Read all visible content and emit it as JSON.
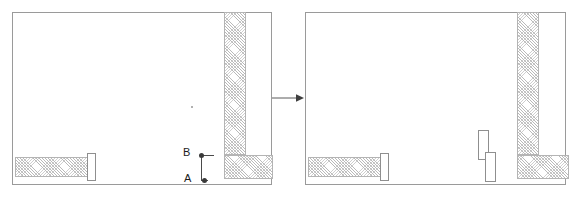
{
  "figure": {
    "name": "wall-opening-transformation-diagram",
    "type": "before-after floor plan pair",
    "panel_count": 2
  },
  "colors": {
    "panel_border": "#9a9a9a",
    "wall_outline": "#b4b4b4",
    "wall_hatch": "#b9b9b9",
    "opening_outline": "#8f8f8f",
    "point_marker": "#3a3a3a",
    "label_text": "#1c1c1c",
    "arrow": "#4a4a4a",
    "background": "#ffffff"
  },
  "before_panel": {
    "label": "before-state-floor-plan",
    "walls": [
      {
        "name": "vertical-wall",
        "x": 211,
        "y": 14,
        "w": 22,
        "h": 141
      },
      {
        "name": "horizontal-wall-right",
        "x": 211,
        "y": 155,
        "w": 47,
        "h": 24
      },
      {
        "name": "horizontal-wall-left",
        "x": 14,
        "y": 157,
        "w": 73,
        "h": 20
      }
    ],
    "openings": [
      {
        "name": "door-opening-left",
        "x": 86,
        "y": 153,
        "w": 9,
        "h": 27
      }
    ],
    "points": [
      {
        "id": "B",
        "label": "B",
        "dot_x": 199,
        "dot_y": 155,
        "label_x": 183,
        "label_y": 147
      },
      {
        "id": "A",
        "label": "A",
        "dot_x": 202,
        "dot_y": 180,
        "label_x": 184,
        "label_y": 173
      }
    ],
    "leader_lines": [
      {
        "name": "leader-vertical",
        "x": 200,
        "y": 155,
        "w": 1,
        "h": 26
      },
      {
        "name": "leader-horizontal-b",
        "x": 200,
        "y": 155,
        "w": 12,
        "h": 1
      },
      {
        "name": "leader-horizontal-a",
        "x": 200,
        "y": 180,
        "w": 6,
        "h": 1
      }
    ],
    "annotation_mark": {
      "name": "tiny-reference-dot",
      "x": 190,
      "y": 106
    }
  },
  "after_panel": {
    "label": "after-state-floor-plan",
    "walls": [
      {
        "name": "vertical-wall",
        "x": 211,
        "y": 14,
        "w": 22,
        "h": 141
      },
      {
        "name": "horizontal-wall-right",
        "x": 211,
        "y": 155,
        "w": 50,
        "h": 24
      },
      {
        "name": "horizontal-wall-left",
        "x": 14,
        "y": 157,
        "w": 73,
        "h": 20
      }
    ],
    "openings": [
      {
        "name": "door-opening-left",
        "x": 86,
        "y": 153,
        "w": 9,
        "h": 27
      },
      {
        "name": "new-opening-upper",
        "x": 174,
        "y": 130,
        "w": 11,
        "h": 29
      },
      {
        "name": "new-opening-lower",
        "x": 181,
        "y": 152,
        "w": 11,
        "h": 29
      }
    ]
  },
  "arrow": {
    "name": "transition-arrow",
    "direction": "right",
    "from_panel": "before-state-floor-plan",
    "to_panel": "after-state-floor-plan"
  }
}
